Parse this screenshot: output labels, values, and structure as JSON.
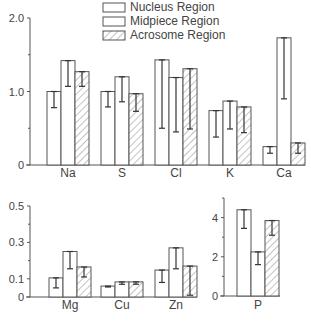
{
  "legend": [
    {
      "label": "Nucleus Region",
      "pattern": "plain"
    },
    {
      "label": "Midpiece Region",
      "pattern": "plain"
    },
    {
      "label": "Acrosome Region",
      "pattern": "hatched"
    }
  ],
  "chart_data": [
    {
      "type": "bar",
      "title": "",
      "xlabel": "",
      "ylabel": "",
      "ylim": [
        0,
        2.0
      ],
      "yticks": [
        "0",
        "1.0",
        "2.0"
      ],
      "grid": false,
      "legend_position": "top-center",
      "categories": [
        "Na",
        "S",
        "Cl",
        "K",
        "Ca"
      ],
      "series": [
        {
          "name": "Nucleus Region",
          "values": [
            1.0,
            1.0,
            1.43,
            0.74,
            0.25
          ],
          "error_low": [
            0.78,
            0.79,
            0.5,
            0.38,
            0.16
          ]
        },
        {
          "name": "Midpiece Region",
          "values": [
            1.42,
            1.2,
            1.19,
            0.87,
            1.73
          ],
          "error_low": [
            1.07,
            0.86,
            0.45,
            0.49,
            0.9
          ]
        },
        {
          "name": "Acrosome Region",
          "values": [
            1.27,
            0.97,
            1.31,
            0.79,
            0.3
          ],
          "error_low": [
            1.07,
            0.73,
            0.49,
            0.44,
            0.16
          ]
        }
      ]
    },
    {
      "type": "bar",
      "title": "",
      "xlabel": "",
      "ylabel": "",
      "ylim": [
        0,
        0.5
      ],
      "yticks": [
        "0",
        "0.1",
        "0.3",
        "0.5"
      ],
      "grid": false,
      "categories": [
        "Mg",
        "Cu",
        "Zn"
      ],
      "series": [
        {
          "name": "Nucleus Region",
          "values": [
            0.105,
            0.06,
            0.148
          ],
          "error_low": [
            0.05,
            0.055,
            0.08
          ]
        },
        {
          "name": "Midpiece Region",
          "values": [
            0.25,
            0.083,
            0.27
          ],
          "error_low": [
            0.155,
            0.07,
            0.155
          ]
        },
        {
          "name": "Acrosome Region",
          "values": [
            0.165,
            0.083,
            0.17
          ],
          "error_low": [
            0.11,
            0.07,
            0.01
          ]
        }
      ]
    },
    {
      "type": "bar",
      "title": "",
      "xlabel": "",
      "ylabel": "",
      "ylim": [
        0,
        5
      ],
      "yticks": [
        "0",
        "2",
        "4"
      ],
      "grid": false,
      "categories": [
        "P"
      ],
      "series": [
        {
          "name": "Nucleus Region",
          "values": [
            4.4
          ],
          "error_low": [
            3.45
          ]
        },
        {
          "name": "Midpiece Region",
          "values": [
            2.25
          ],
          "error_low": [
            1.6
          ]
        },
        {
          "name": "Acrosome Region",
          "values": [
            3.85
          ],
          "error_low": [
            3.1
          ]
        }
      ]
    }
  ]
}
